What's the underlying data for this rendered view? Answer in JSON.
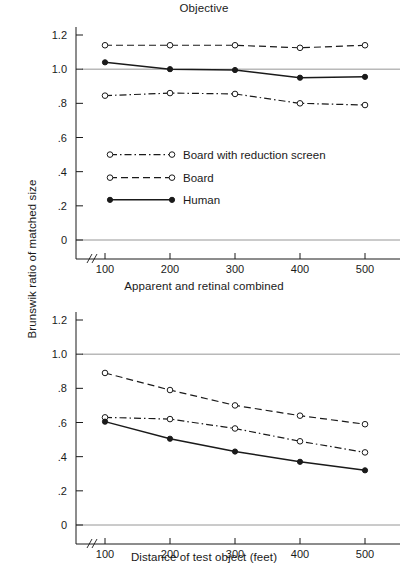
{
  "figure": {
    "y_axis_title": "Brunswik ratio of matched size",
    "x_axis_title": "Distance of test object (feet)"
  },
  "legend": {
    "items": [
      {
        "label": "Board with reduction screen",
        "style": "dash-dot",
        "marker": "open-circle"
      },
      {
        "label": "Board",
        "style": "dashed",
        "marker": "open-circle"
      },
      {
        "label": "Human",
        "style": "solid",
        "marker": "filled-circle"
      }
    ]
  },
  "axes": {
    "y_ticks": [
      "0",
      ".2",
      ".4",
      ".6",
      ".8",
      "1.0",
      "1.2"
    ],
    "y_tick_values": [
      0,
      0.2,
      0.4,
      0.6,
      0.8,
      1.0,
      1.2
    ],
    "x_ticks": [
      "100",
      "200",
      "300",
      "400",
      "500"
    ],
    "x_tick_values": [
      100,
      200,
      300,
      400,
      500
    ],
    "axis_break": "//"
  },
  "chart_data": [
    {
      "type": "line",
      "title": "Objective",
      "xlabel": "Distance of test object (feet)",
      "ylabel": "Brunswik ratio of matched size",
      "x": [
        100,
        200,
        300,
        400,
        500
      ],
      "xlim": [
        100,
        500
      ],
      "ylim": [
        0,
        1.2
      ],
      "grid": false,
      "reference_lines": [
        0,
        1.0
      ],
      "legend_position": "center-left",
      "series": [
        {
          "name": "Board with reduction screen",
          "values": [
            0.845,
            0.86,
            0.855,
            0.8,
            0.79
          ],
          "style": "dash-dot",
          "marker": "open-circle"
        },
        {
          "name": "Board",
          "values": [
            1.14,
            1.14,
            1.14,
            1.125,
            1.14
          ],
          "style": "dashed",
          "marker": "open-circle"
        },
        {
          "name": "Human",
          "values": [
            1.04,
            1.0,
            0.995,
            0.95,
            0.955
          ],
          "style": "solid",
          "marker": "filled-circle"
        }
      ]
    },
    {
      "type": "line",
      "title": "Apparent and retinal combined",
      "xlabel": "Distance of test object (feet)",
      "ylabel": "Brunswik ratio of matched size",
      "x": [
        100,
        200,
        300,
        400,
        500
      ],
      "xlim": [
        100,
        500
      ],
      "ylim": [
        0,
        1.2
      ],
      "grid": false,
      "reference_lines": [
        0,
        1.0
      ],
      "legend_position": "none",
      "series": [
        {
          "name": "Board with reduction screen",
          "values": [
            0.63,
            0.62,
            0.565,
            0.49,
            0.425
          ],
          "style": "dash-dot",
          "marker": "open-circle"
        },
        {
          "name": "Board",
          "values": [
            0.89,
            0.79,
            0.7,
            0.64,
            0.59
          ],
          "style": "dashed",
          "marker": "open-circle"
        },
        {
          "name": "Human",
          "values": [
            0.605,
            0.505,
            0.43,
            0.37,
            0.32
          ],
          "style": "solid",
          "marker": "filled-circle"
        }
      ]
    }
  ]
}
